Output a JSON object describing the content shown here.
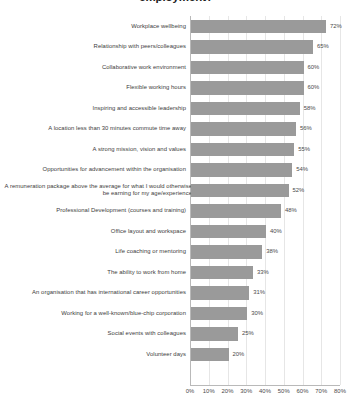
{
  "chart_data": {
    "type": "bar",
    "orientation": "horizontal",
    "title": "employment?",
    "title_note": "title is clipped at the top edge of the screenshot",
    "xlabel": "",
    "ylabel": "",
    "xlim": [
      0,
      80
    ],
    "grid": true,
    "legend": false,
    "value_suffix": "%",
    "xticks": [
      "0%",
      "10%",
      "20%",
      "30%",
      "40%",
      "50%",
      "60%",
      "70%",
      "80%"
    ],
    "xtick_values": [
      0,
      10,
      20,
      30,
      40,
      50,
      60,
      70,
      80
    ],
    "bar_color": "#9a9a9a",
    "categories": [
      "Workplace wellbeing",
      "Relationship with peers/colleagues",
      "Collaborative work environment",
      "Flexible working hours",
      "Inspiring and accessible leadership",
      "A location less than 30 minutes commute time away",
      "A strong mission, vision and values",
      "Opportunities for advancement within the organisation",
      "A remuneration package above the average for what I would otherwise be earning for my age/experience",
      "Professional Development (courses and training)",
      "Office layout and workspace",
      "Life coaching or mentoring",
      "The ability to work from home",
      "An organisation that has international career opportunities",
      "Working for a well-known/blue-chip corporation",
      "Social events with colleagues",
      "Volunteer days"
    ],
    "values": [
      72,
      65,
      60,
      60,
      58,
      56,
      55,
      54,
      52,
      48,
      40,
      38,
      33,
      31,
      30,
      25,
      20
    ],
    "value_labels": [
      "72%",
      "65%",
      "60%",
      "60%",
      "58%",
      "56%",
      "55%",
      "54%",
      "52%",
      "48%",
      "40%",
      "38%",
      "33%",
      "31%",
      "30%",
      "25%",
      "20%"
    ]
  }
}
